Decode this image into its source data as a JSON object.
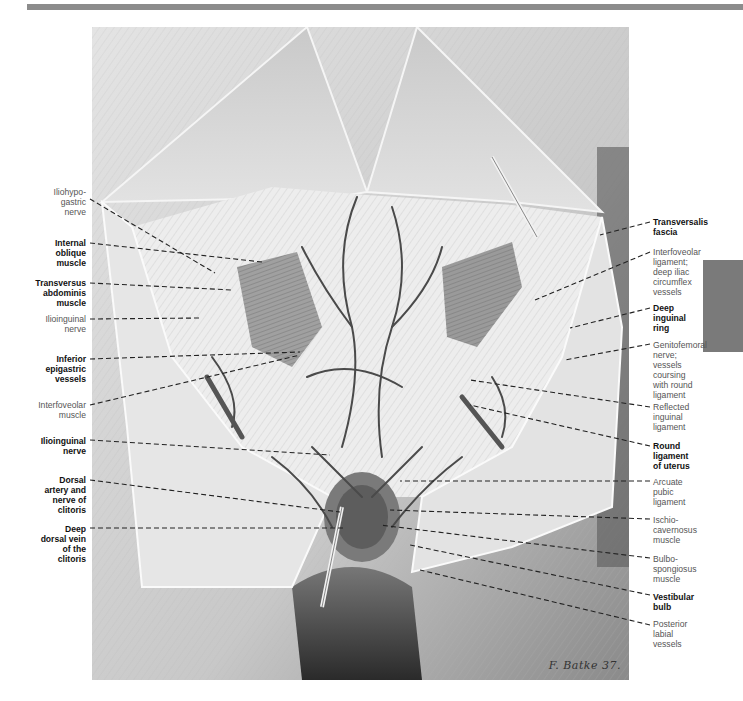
{
  "header": {
    "bar_color": "#8c8c8c"
  },
  "side_tab": {
    "color": "#7a7a7a"
  },
  "figure": {
    "signature": "F. Batke 37."
  },
  "labels_left": [
    {
      "id": "iliohypogastric-nerve",
      "lines": [
        "Iliohypo-",
        "gastric",
        "nerve"
      ],
      "bold": false,
      "top": 187
    },
    {
      "id": "internal-oblique-muscle",
      "lines": [
        "Internal",
        "oblique",
        "muscle"
      ],
      "bold": true,
      "top": 238
    },
    {
      "id": "transversus-abdominis-muscle",
      "lines": [
        "Transversus",
        "abdominis",
        "muscle"
      ],
      "bold": true,
      "top": 278
    },
    {
      "id": "ilioinguinal-nerve-upper",
      "lines": [
        "Ilioinguinal",
        "nerve"
      ],
      "bold": false,
      "top": 316
    },
    {
      "id": "inferior-epigastric-vessels",
      "lines": [
        "Inferior",
        "epigastric",
        "vessels"
      ],
      "bold": true,
      "top": 355
    },
    {
      "id": "interfoveolar-muscle",
      "lines": [
        "Interfoveolar",
        "muscle"
      ],
      "bold": false,
      "top": 400
    },
    {
      "id": "ilioinguinal-nerve-lower",
      "lines": [
        "Ilioinguinal",
        "nerve"
      ],
      "bold": true,
      "top": 437
    },
    {
      "id": "dorsal-artery-nerve-clitoris",
      "lines": [
        "Dorsal",
        "artery and",
        "nerve of",
        "clitoris"
      ],
      "bold": true,
      "top": 475
    },
    {
      "id": "deep-dorsal-vein-clitoris",
      "lines": [
        "Deep",
        "dorsal vein",
        "of the",
        "clitoris"
      ],
      "bold": true,
      "top": 524
    }
  ],
  "labels_right": [
    {
      "id": "transversalis-fascia",
      "lines": [
        "Transversalis",
        "fascia"
      ],
      "bold": true,
      "top": 217
    },
    {
      "id": "interfoveolar-ligament",
      "lines": [
        "Interfoveolar",
        "ligament;",
        "deep iliac",
        "circumflex",
        "vessels"
      ],
      "bold": false,
      "top": 247
    },
    {
      "id": "deep-inguinal-ring",
      "lines": [
        "Deep",
        "inguinal",
        "ring"
      ],
      "bold": true,
      "top": 303
    },
    {
      "id": "genitofemoral-nerve",
      "lines": [
        "Genitofemoral",
        "nerve;",
        "vessels",
        "coursing",
        "with round",
        "ligament"
      ],
      "bold": false,
      "top": 340
    },
    {
      "id": "reflected-inguinal-ligament",
      "lines": [
        "Reflected",
        "inguinal",
        "ligament"
      ],
      "bold": false,
      "top": 402
    },
    {
      "id": "round-ligament-uterus",
      "lines": [
        "Round",
        "ligament",
        "of uterus"
      ],
      "bold": true,
      "top": 441
    },
    {
      "id": "arcuate-pubic-ligament",
      "lines": [
        "Arcuate",
        "pubic",
        "ligament"
      ],
      "bold": false,
      "top": 477
    },
    {
      "id": "ischiocavernosus-muscle",
      "lines": [
        "Ischio-",
        "cavernosus",
        "muscle"
      ],
      "bold": false,
      "top": 515
    },
    {
      "id": "bulbospongiosus-muscle",
      "lines": [
        "Bulbo-",
        "spongiosus",
        "muscle"
      ],
      "bold": false,
      "top": 554
    },
    {
      "id": "vestibular-bulb",
      "lines": [
        "Vestibular",
        "bulb"
      ],
      "bold": true,
      "top": 592
    },
    {
      "id": "posterior-labial-vessels",
      "lines": [
        "Posterior",
        "labial",
        "vessels"
      ],
      "bold": false,
      "top": 619
    }
  ]
}
